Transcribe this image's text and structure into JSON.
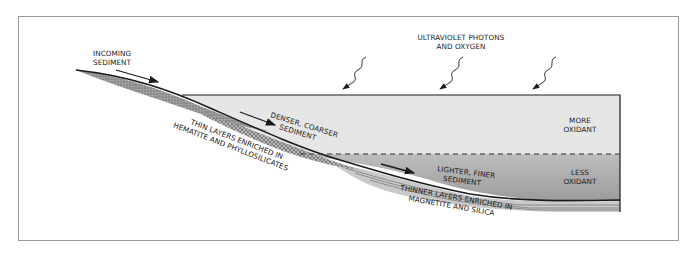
{
  "diagram": {
    "labels": {
      "incoming_1": "INCOMING",
      "incoming_2": "SEDIMENT",
      "uv_1": "ULTRAVIOLET PHOTONS",
      "uv_2": "AND OXYGEN",
      "more_1": "MORE",
      "more_2": "OXIDANT",
      "less_1": "LESS",
      "less_2": "OXIDANT",
      "denser_1": "DENSER, COARSER",
      "denser_2": "SEDIMENT",
      "lighter_1": "LIGHTER, FINER",
      "lighter_2": "SEDIMENT",
      "thin_1": "THIN LAYERS ENRICHED IN",
      "thin_2": "HEMATITE AND PHYLLOSILICATES",
      "thinner_1": "THINNER LAYERS ENRICHED IN",
      "thinner_2": "MAGNETITE AND SILICA"
    },
    "colors": {
      "upper_water": "#e6e6e6",
      "lower_water": "#a9a9a9",
      "sediment": "#8e8e8e",
      "line": "#1a1a1a",
      "frame": "#9a9a9a"
    }
  }
}
